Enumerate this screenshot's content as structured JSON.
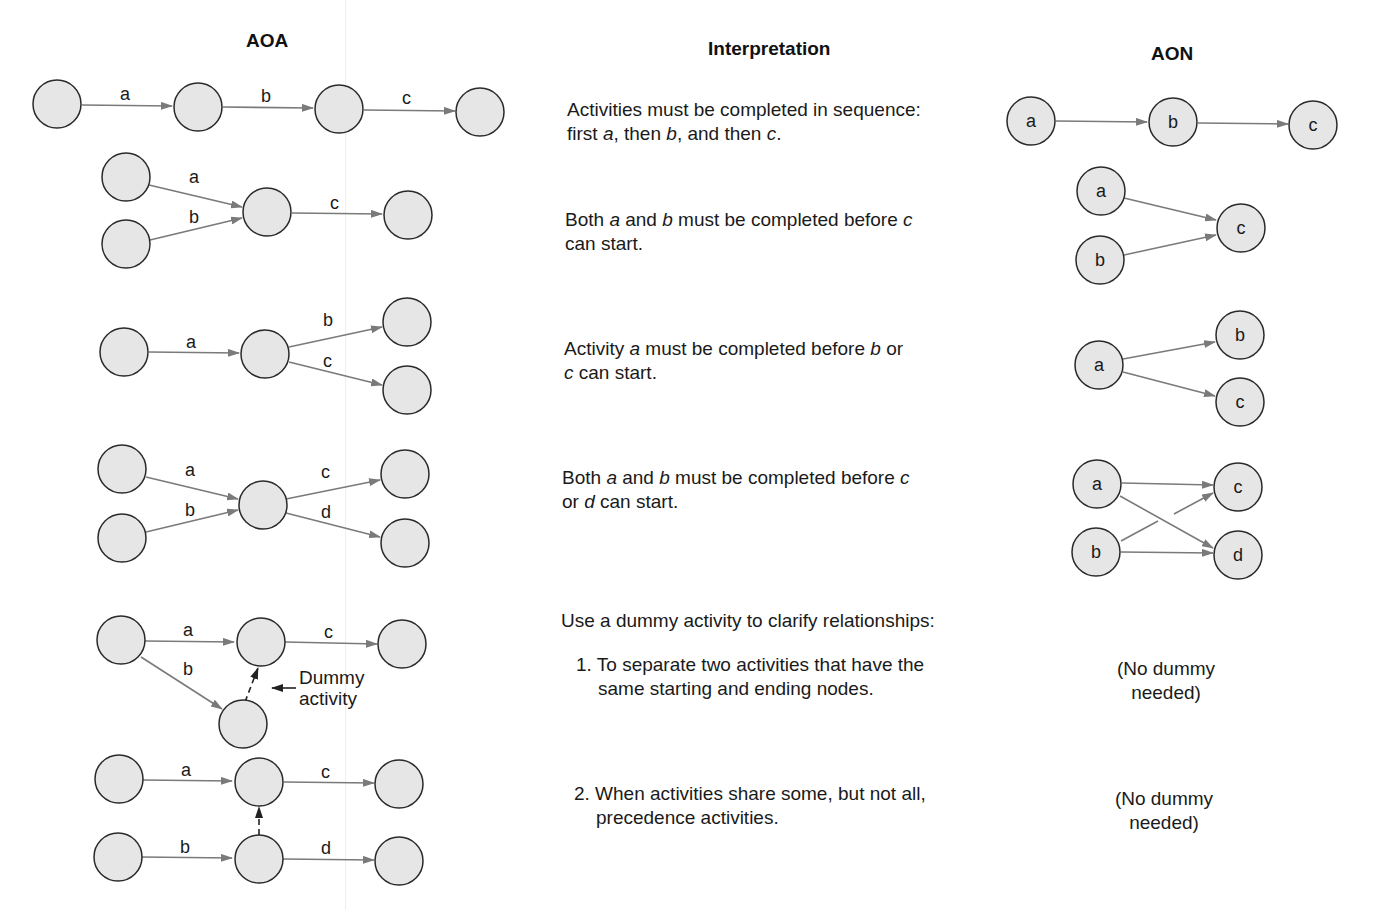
{
  "caption": "Network conventions",
  "headers": {
    "aoa": "AOA",
    "interpretation": "Interpretation",
    "aon": "AON"
  },
  "rows": [
    {
      "interpretation_line1": "Activities must be completed in sequence:",
      "interpretation_line2": "first a, then b, and then c."
    },
    {
      "interpretation_line1": "Both a and b must be completed before c",
      "interpretation_line2": "can start."
    },
    {
      "interpretation_line1": "Activity a must be completed before b or",
      "interpretation_line2": "c can start."
    },
    {
      "interpretation_line1": "Both a and b must be completed before c",
      "interpretation_line2": "or d can start."
    }
  ],
  "dummy_section": {
    "intro": "Use a dummy activity to clarify relationships:",
    "item1_line1": "1. To separate two activities that have the",
    "item1_line2": "same starting and ending nodes.",
    "item2_line1": "2. When activities share some, but not all,",
    "item2_line2": "precedence activities.",
    "no_dummy_line1": "(No dummy",
    "no_dummy_line2": "needed)",
    "dummy_label_line1": "Dummy",
    "dummy_label_line2": "activity"
  },
  "activity_labels": [
    "a",
    "b",
    "c",
    "d"
  ],
  "colors": {
    "node_fill": "#e6e6e6",
    "node_stroke": "#2a2a2a",
    "edge": "#7a7a7a"
  }
}
